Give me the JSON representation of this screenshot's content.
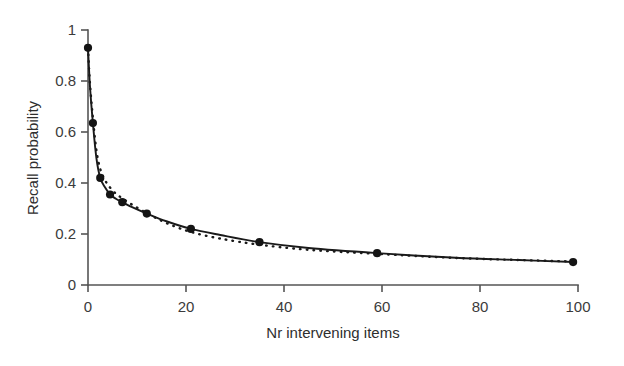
{
  "figure": {
    "background_color": "#ffffff",
    "line_color": "#1a1a1a",
    "axis_color": "#555555",
    "marker_color": "#141414"
  },
  "axes": {
    "x_title": "Nr intervening items",
    "y_title": "Recall probability",
    "x_ticks": [
      "0",
      "20",
      "40",
      "60",
      "80",
      "100"
    ],
    "y_ticks": [
      "0",
      "0.2",
      "0.4",
      "0.6",
      "0.8",
      "1"
    ]
  },
  "chart_data": {
    "type": "scatter",
    "title": "",
    "xlabel": "Nr intervening items",
    "ylabel": "Recall probability",
    "xlim": [
      0,
      100
    ],
    "ylim": [
      0,
      1
    ],
    "xticks": [
      0,
      20,
      40,
      60,
      80,
      100
    ],
    "yticks": [
      0,
      0.2,
      0.4,
      0.6,
      0.8,
      1
    ],
    "grid": false,
    "legend": "none",
    "x": [
      0,
      1,
      2.5,
      4.5,
      7,
      12,
      21,
      35,
      59,
      99
    ],
    "observed": [
      0.93,
      0.635,
      0.42,
      0.355,
      0.325,
      0.28,
      0.22,
      0.168,
      0.125,
      0.09
    ],
    "series": [
      {
        "name": "observed data points",
        "style": "markers",
        "x": [
          0,
          1,
          2.5,
          4.5,
          7,
          12,
          21,
          35,
          59,
          99
        ],
        "values": [
          0.93,
          0.635,
          0.42,
          0.355,
          0.325,
          0.28,
          0.22,
          0.168,
          0.125,
          0.09
        ]
      },
      {
        "name": "solid fit",
        "style": "solid-line",
        "x": [
          0,
          0.4,
          1,
          1.7,
          2.5,
          3.5,
          4.5,
          5.7,
          7,
          9,
          12,
          16,
          21,
          27,
          35,
          45,
          59,
          75,
          88,
          99
        ],
        "values": [
          0.93,
          0.78,
          0.635,
          0.5,
          0.42,
          0.382,
          0.355,
          0.338,
          0.325,
          0.305,
          0.28,
          0.25,
          0.22,
          0.196,
          0.168,
          0.145,
          0.125,
          0.107,
          0.098,
          0.09
        ]
      },
      {
        "name": "dotted fit",
        "style": "dotted-line",
        "x": [
          0,
          0.4,
          1,
          1.7,
          2.5,
          3.5,
          4.5,
          5.7,
          7,
          9,
          12,
          16,
          21,
          27,
          35,
          45,
          59,
          75,
          88,
          99
        ],
        "values": [
          0.93,
          0.79,
          0.655,
          0.53,
          0.455,
          0.41,
          0.382,
          0.358,
          0.34,
          0.315,
          0.282,
          0.243,
          0.208,
          0.182,
          0.158,
          0.138,
          0.122,
          0.106,
          0.098,
          0.092
        ]
      }
    ]
  }
}
